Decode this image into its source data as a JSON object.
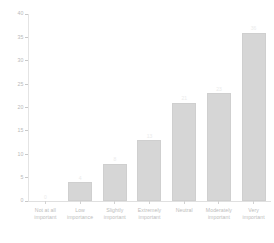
{
  "chart_data": {
    "type": "bar",
    "title": "",
    "subtitle": "",
    "xlabel": "",
    "ylabel": "",
    "categories": [
      "Not at all\nimportant",
      "Low\nimportance",
      "Slightly\nimportant",
      "Extremely\nimportant",
      "Neutral",
      "Moderately\nimportant",
      "Very\nimportant"
    ],
    "values": [
      0,
      4,
      8,
      13,
      21,
      23,
      36
    ],
    "value_labels": [
      "0",
      "4",
      "8",
      "13",
      "21",
      "23",
      "36"
    ],
    "ylim": [
      0,
      40
    ],
    "yticks": [
      0,
      5,
      10,
      15,
      20,
      25,
      30,
      35,
      40
    ],
    "ytick_labels": [
      "0",
      "5",
      "10",
      "15",
      "20",
      "25",
      "30",
      "35",
      "40"
    ],
    "grid": false,
    "legend": null,
    "colors": {
      "bar_fill": "#d6d6d6",
      "bar_edge": "#cfcfcf",
      "axis_line": "#e0e0e0",
      "tick_label": "#bdbdbd",
      "background": "#ffffff"
    }
  }
}
